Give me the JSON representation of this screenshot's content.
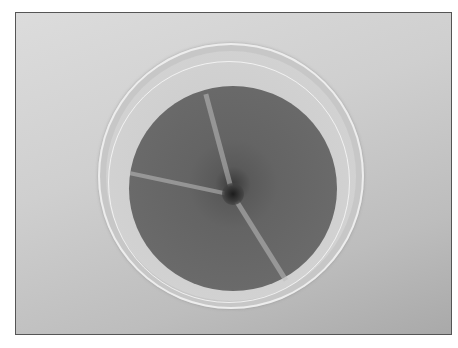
{
  "image": {
    "subject": "petri-dish-fungal-colony",
    "description": "Grayscale photograph of a circular petri dish containing a dark, sectored fungal colony with a darker center",
    "colors": {
      "background": "#cfcfcf",
      "colony": "#646464",
      "center": "#1c1c1c",
      "frame_border": "#555555"
    }
  }
}
